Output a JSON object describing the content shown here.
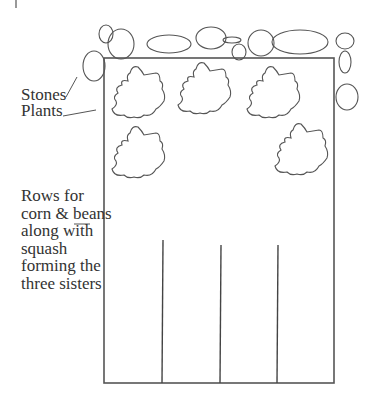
{
  "diagram": {
    "labels": {
      "stones": "Stones",
      "plants": "Plants",
      "rows_lines": [
        "Rows for",
        "corn & beans",
        "along with",
        "squash",
        "forming the",
        "three sisters"
      ]
    },
    "colors": {
      "stroke": "#555555",
      "text": "#333333",
      "background": "#ffffff"
    },
    "garden_bed": {
      "x": 104,
      "y": 58,
      "width": 230,
      "height": 325
    },
    "stones": [
      {
        "cx": 106,
        "cy": 34,
        "rx": 7,
        "ry": 9
      },
      {
        "cx": 121,
        "cy": 44,
        "rx": 13,
        "ry": 15
      },
      {
        "cx": 94,
        "cy": 66,
        "rx": 11,
        "ry": 15
      },
      {
        "cx": 169,
        "cy": 44,
        "rx": 22,
        "ry": 9
      },
      {
        "cx": 211,
        "cy": 38,
        "rx": 15,
        "ry": 11
      },
      {
        "cx": 232,
        "cy": 40,
        "rx": 9,
        "ry": 3
      },
      {
        "cx": 239,
        "cy": 52,
        "rx": 7,
        "ry": 8
      },
      {
        "cx": 261,
        "cy": 43,
        "rx": 13,
        "ry": 13
      },
      {
        "cx": 300,
        "cy": 42,
        "rx": 28,
        "ry": 12
      },
      {
        "cx": 345,
        "cy": 41,
        "rx": 9,
        "ry": 8
      },
      {
        "cx": 345,
        "cy": 62,
        "rx": 6,
        "ry": 11
      },
      {
        "cx": 347,
        "cy": 97,
        "rx": 11,
        "ry": 13
      }
    ],
    "plants": [
      {
        "cx": 142,
        "cy": 95
      },
      {
        "cx": 208,
        "cy": 91
      },
      {
        "cx": 277,
        "cy": 95
      },
      {
        "cx": 142,
        "cy": 155
      },
      {
        "cx": 305,
        "cy": 152
      }
    ],
    "rows": [
      {
        "x": 162,
        "y1": 240,
        "y2": 383
      },
      {
        "x": 220,
        "y1": 245,
        "y2": 383
      },
      {
        "x": 277,
        "y1": 245,
        "y2": 383
      }
    ]
  }
}
